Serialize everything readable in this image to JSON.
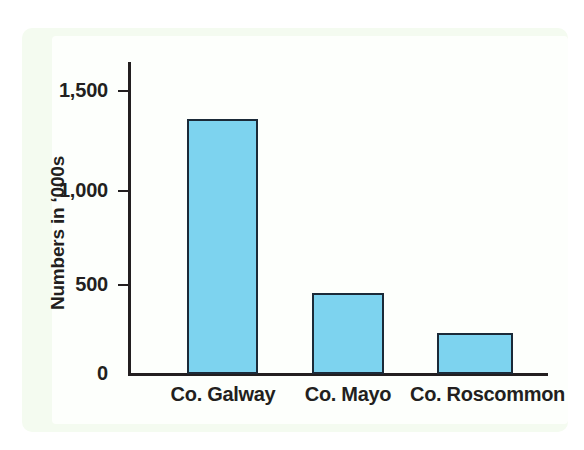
{
  "chart_data": {
    "type": "bar",
    "title": "",
    "xlabel": "",
    "ylabel": "Numbers in ‘000s",
    "categories": [
      "Co. Galway",
      "Co. Mayo",
      "Co. Roscommon"
    ],
    "values": [
      1430,
      455,
      230
    ],
    "ylim": [
      0,
      1500
    ],
    "ytick_values": [
      0,
      500,
      1000,
      1500
    ],
    "ytick_labels": [
      "0",
      "500",
      "1,000",
      "1,500"
    ],
    "grid": false,
    "legend": null,
    "series": [
      {
        "name": "Numbers in ‘000s",
        "values": [
          1430,
          455,
          230
        ]
      }
    ],
    "colors": {
      "bar_fill": "#7dd3ef",
      "bar_border": "#1b2a38",
      "axis": "#231f20",
      "text": "#231f20",
      "panel_background": "#f4fbf0",
      "plot_background": "#fdfffc"
    }
  }
}
